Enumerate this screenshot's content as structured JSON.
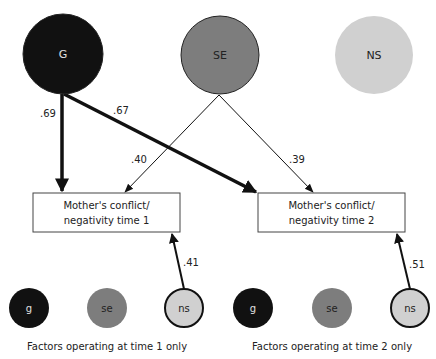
{
  "diagram": {
    "latent_factors": [
      {
        "id": "G",
        "label": "G",
        "fill": "#111111",
        "text_color": "#e0e0e0",
        "stroke": "#222222"
      },
      {
        "id": "SE",
        "label": "SE",
        "fill": "#7d7d7d",
        "text_color": "#222222",
        "stroke": "#222222"
      },
      {
        "id": "NS",
        "label": "NS",
        "fill": "#d0d0d0",
        "text_color": "#222222",
        "stroke": "none"
      }
    ],
    "observed": [
      {
        "id": "mcn1",
        "line1": "Mother's conflict/",
        "line2": "negativity time 1"
      },
      {
        "id": "mcn2",
        "line1": "Mother's conflict/",
        "line2": "negativity time 2"
      }
    ],
    "paths": [
      {
        "from": "G",
        "to": "mcn1",
        "value": ".69",
        "weight": "thick"
      },
      {
        "from": "G",
        "to": "mcn2",
        "value": ".67",
        "weight": "thick"
      },
      {
        "from": "SE",
        "to": "mcn1",
        "value": ".40",
        "weight": "thin"
      },
      {
        "from": "SE",
        "to": "mcn2",
        "value": ".39",
        "weight": "thin"
      },
      {
        "from": "ns_t1",
        "to": "mcn1",
        "value": ".41",
        "weight": "medium"
      },
      {
        "from": "ns_t2",
        "to": "mcn2",
        "value": ".51",
        "weight": "medium"
      }
    ],
    "time_specific_groups": [
      {
        "caption": "Factors operating at time 1 only",
        "factors": [
          {
            "id": "g_t1",
            "label": "g",
            "fill": "#111111",
            "text_color": "#e0e0e0"
          },
          {
            "id": "se_t1",
            "label": "se",
            "fill": "#7d7d7d",
            "text_color": "#222222"
          },
          {
            "id": "ns_t1",
            "label": "ns",
            "fill": "#d0d0d0",
            "text_color": "#222222"
          }
        ]
      },
      {
        "caption": "Factors operating at time 2 only",
        "factors": [
          {
            "id": "g_t2",
            "label": "g",
            "fill": "#111111",
            "text_color": "#e0e0e0"
          },
          {
            "id": "se_t2",
            "label": "se",
            "fill": "#7d7d7d",
            "text_color": "#222222"
          },
          {
            "id": "ns_t2",
            "label": "ns",
            "fill": "#d0d0d0",
            "text_color": "#222222"
          }
        ]
      }
    ]
  }
}
